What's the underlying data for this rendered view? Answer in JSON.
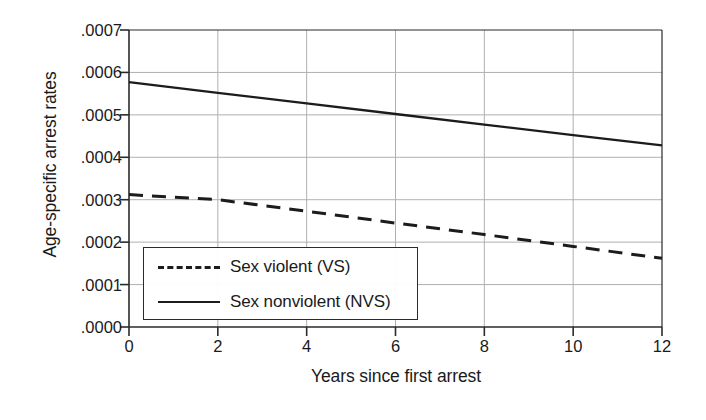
{
  "chart_data": {
    "type": "line",
    "title": "",
    "xlabel": "Years since first arrest",
    "ylabel": "Age-specific arrest rates",
    "xlim": [
      0,
      12
    ],
    "ylim": [
      0.0,
      0.0007
    ],
    "xticks": [
      "0",
      "2",
      "4",
      "6",
      "8",
      "10",
      "12"
    ],
    "xtick_values": [
      0,
      2,
      4,
      6,
      8,
      10,
      12
    ],
    "yticks": [
      ".0000",
      ".0001",
      ".0002",
      ".0003",
      ".0004",
      ".0005",
      ".0006",
      ".0007"
    ],
    "ytick_values": [
      0.0,
      0.0001,
      0.0002,
      0.0003,
      0.0004,
      0.0005,
      0.0006,
      0.0007
    ],
    "grid": true,
    "legend_position": "lower left",
    "x": [
      0,
      2,
      4,
      6,
      8,
      10,
      12
    ],
    "series": [
      {
        "name": "Sex violent (VS)",
        "style": "dashed",
        "color": "#1c1c1c",
        "values": [
          0.000312,
          0.0003,
          0.000273,
          0.000245,
          0.000218,
          0.00019,
          0.000162
        ]
      },
      {
        "name": "Sex nonviolent (NVS)",
        "style": "solid",
        "color": "#1c1c1c",
        "values": [
          0.000577,
          0.000552,
          0.000527,
          0.000502,
          0.000477,
          0.000452,
          0.000428
        ]
      }
    ]
  },
  "legend": {
    "entries": [
      {
        "label": "Sex violent (VS)",
        "style": "dashed"
      },
      {
        "label": "Sex nonviolent (NVS)",
        "style": "solid"
      }
    ]
  },
  "axes": {
    "x_title": "Years since first arrest",
    "y_title": "Age-specific arrest rates",
    "x_tick_labels": [
      "0",
      "2",
      "4",
      "6",
      "8",
      "10",
      "12"
    ],
    "y_tick_labels": [
      ".0007",
      ".0006",
      ".0005",
      ".0004",
      ".0003",
      ".0002",
      ".0001",
      ".0000"
    ]
  },
  "colors": {
    "background": "#ffffff",
    "axis": "#2b2b2b",
    "grid": "#b4b4b4",
    "line": "#1c1c1c",
    "text": "#1a1a1a"
  }
}
